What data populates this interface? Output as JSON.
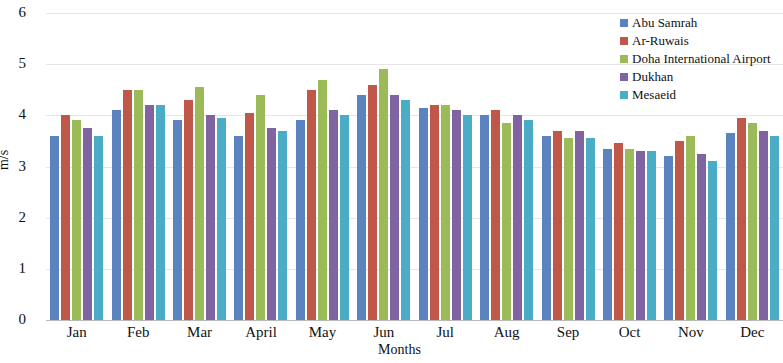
{
  "chart_data": {
    "type": "bar",
    "title": "",
    "xlabel": "Months",
    "ylabel": "m/s",
    "ylim": [
      0,
      6
    ],
    "y_ticks": [
      0,
      1,
      2,
      3,
      4,
      5,
      6
    ],
    "grid": true,
    "legend_position": "top-right",
    "categories": [
      "Jan",
      "Feb",
      "Mar",
      "April",
      "May",
      "Jun",
      "Jul",
      "Aug",
      "Sep",
      "Oct",
      "Nov",
      "Dec"
    ],
    "series": [
      {
        "name": "Abu Samrah",
        "color": "#5B83C0",
        "values": [
          3.6,
          4.1,
          3.9,
          3.6,
          3.9,
          4.4,
          4.15,
          4.0,
          3.6,
          3.35,
          3.2,
          3.65
        ]
      },
      {
        "name": "Ar-Ruwais",
        "color": "#C0584A",
        "values": [
          4.0,
          4.5,
          4.3,
          4.05,
          4.5,
          4.6,
          4.2,
          4.1,
          3.7,
          3.45,
          3.5,
          3.95
        ]
      },
      {
        "name": "Doha International Airport",
        "color": "#9BBB59",
        "values": [
          3.9,
          4.5,
          4.55,
          4.4,
          4.7,
          4.9,
          4.2,
          3.85,
          3.55,
          3.35,
          3.6,
          3.85
        ]
      },
      {
        "name": "Dukhan",
        "color": "#8064A2",
        "values": [
          3.75,
          4.2,
          4.0,
          3.75,
          4.1,
          4.4,
          4.1,
          4.0,
          3.7,
          3.3,
          3.25,
          3.7
        ]
      },
      {
        "name": "Mesaeid",
        "color": "#4BACC6",
        "values": [
          3.6,
          4.2,
          3.95,
          3.7,
          4.0,
          4.3,
          4.0,
          3.9,
          3.55,
          3.3,
          3.1,
          3.6
        ]
      }
    ]
  },
  "axes": {
    "y_title": "m/s",
    "x_title": "Months"
  }
}
